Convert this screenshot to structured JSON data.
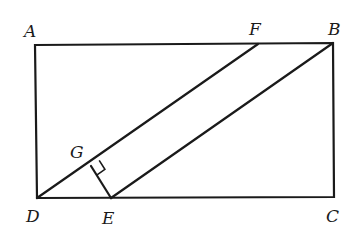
{
  "diagram": {
    "type": "geometry",
    "points": {
      "A": {
        "label": "A",
        "x": 35,
        "y": 45,
        "label_x": 24,
        "label_y": 37
      },
      "B": {
        "label": "B",
        "x": 333,
        "y": 43,
        "label_x": 328,
        "label_y": 35
      },
      "C": {
        "label": "C",
        "x": 334,
        "y": 197,
        "label_x": 326,
        "label_y": 222
      },
      "D": {
        "label": "D",
        "x": 37,
        "y": 198,
        "label_x": 26,
        "label_y": 222
      },
      "E": {
        "label": "E",
        "x": 111,
        "y": 198,
        "label_x": 102,
        "label_y": 224
      },
      "F": {
        "label": "F",
        "x": 258,
        "y": 44,
        "label_x": 249,
        "label_y": 35
      },
      "G": {
        "label": "G",
        "x": 91,
        "y": 166,
        "label_x": 70,
        "label_y": 158
      }
    },
    "segments": [
      "AB",
      "BC",
      "CD",
      "DA",
      "DF",
      "EB",
      "GE"
    ],
    "right_angle_marker": {
      "at": "G",
      "between": [
        "GF",
        "GE"
      ]
    }
  }
}
